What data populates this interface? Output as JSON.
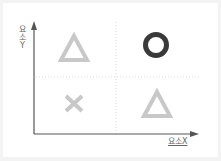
{
  "diagram": {
    "type": "2x2 matrix",
    "axes": {
      "y_label": "요소Y",
      "x_label": "요소X"
    },
    "quadrants": [
      {
        "position": "top-left",
        "symbol": "△",
        "name": "triangle",
        "color": "#c8c8c8"
      },
      {
        "position": "top-right",
        "symbol": "○",
        "name": "circle",
        "color": "#3a3a3a"
      },
      {
        "position": "bottom-left",
        "symbol": "×",
        "name": "cross",
        "color": "#c8c8c8"
      },
      {
        "position": "bottom-right",
        "symbol": "△",
        "name": "triangle",
        "color": "#c8c8c8"
      }
    ],
    "colors": {
      "axis": "#555555",
      "gridline": "#dddddd",
      "background": "#ffffff",
      "frame": "#f3f3f3"
    }
  }
}
